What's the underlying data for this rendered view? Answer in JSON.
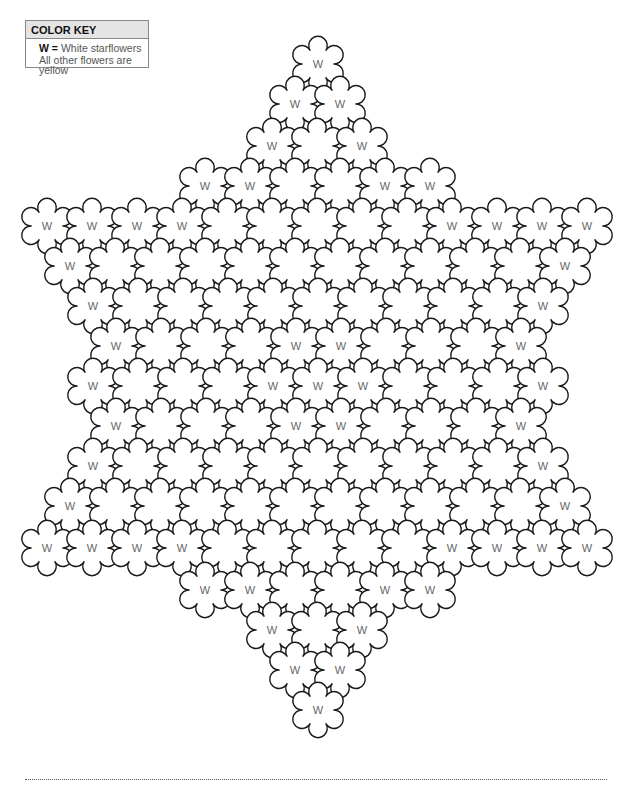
{
  "color_key": {
    "title": "COLOR KEY",
    "w_symbol": "W",
    "w_separator": " = ",
    "w_meaning": "White starflowers",
    "other": "All other flowers are yellow"
  },
  "flower_label": "W",
  "colors": {
    "outline": "#1a1a1a",
    "label": "#666666",
    "key_header_bg": "#e4e4e4"
  },
  "flower_radius": 22,
  "rows": [
    {
      "y": 64,
      "start_x": 318,
      "count": 1,
      "w": [
        0
      ]
    },
    {
      "y": 104,
      "start_x": 295,
      "count": 2,
      "w": [
        0,
        1
      ]
    },
    {
      "y": 146,
      "start_x": 272,
      "count": 3,
      "w": [
        0,
        2
      ]
    },
    {
      "y": 186,
      "start_x": 205,
      "count": 6,
      "w": [
        0,
        1,
        4,
        5
      ]
    },
    {
      "y": 226,
      "start_x": 47,
      "count": 13,
      "w": [
        0,
        1,
        2,
        3,
        9,
        10,
        11,
        12
      ]
    },
    {
      "y": 266,
      "start_x": 70,
      "count": 12,
      "w": [
        0,
        11
      ]
    },
    {
      "y": 306,
      "start_x": 93,
      "count": 11,
      "w": [
        0,
        10
      ]
    },
    {
      "y": 346,
      "start_x": 116,
      "count": 10,
      "w": [
        0,
        4,
        5,
        9
      ]
    },
    {
      "y": 386,
      "start_x": 93,
      "count": 11,
      "w": [
        0,
        4,
        5,
        6,
        10
      ]
    },
    {
      "y": 426,
      "start_x": 116,
      "count": 10,
      "w": [
        0,
        4,
        5,
        9
      ]
    },
    {
      "y": 466,
      "start_x": 93,
      "count": 11,
      "w": [
        0,
        10
      ]
    },
    {
      "y": 506,
      "start_x": 70,
      "count": 12,
      "w": [
        0,
        11
      ]
    },
    {
      "y": 548,
      "start_x": 47,
      "count": 13,
      "w": [
        0,
        1,
        2,
        3,
        9,
        10,
        11,
        12
      ]
    },
    {
      "y": 590,
      "start_x": 205,
      "count": 6,
      "w": [
        0,
        1,
        4,
        5
      ]
    },
    {
      "y": 630,
      "start_x": 272,
      "count": 3,
      "w": [
        0,
        2
      ]
    },
    {
      "y": 670,
      "start_x": 295,
      "count": 2,
      "w": [
        0,
        1
      ]
    },
    {
      "y": 710,
      "start_x": 318,
      "count": 1,
      "w": [
        0
      ]
    }
  ],
  "spacing_x": 45
}
